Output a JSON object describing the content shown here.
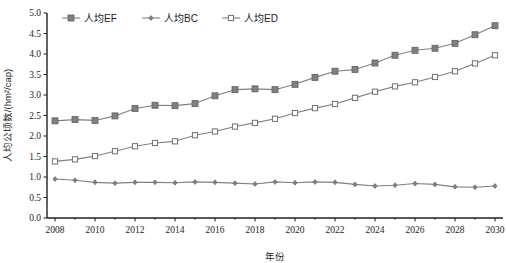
{
  "chart_data": {
    "type": "line",
    "title": "",
    "xlabel": "年份",
    "ylabel": "人均公顷数/(hm²/cap)",
    "xlim": [
      2007.6,
      2030.4
    ],
    "ylim": [
      0.0,
      5.0
    ],
    "ytick_step": 0.5,
    "xtick_step": 2,
    "grid": false,
    "legend_position": "top-left",
    "x": [
      2008,
      2009,
      2010,
      2011,
      2012,
      2013,
      2014,
      2015,
      2016,
      2017,
      2018,
      2019,
      2020,
      2021,
      2022,
      2023,
      2024,
      2025,
      2026,
      2027,
      2028,
      2029,
      2030
    ],
    "xticks": [
      "2008",
      "2010",
      "2012",
      "2014",
      "2016",
      "2018",
      "2020",
      "2022",
      "2024",
      "2026",
      "2028",
      "2030"
    ],
    "xtick_values": [
      2008,
      2010,
      2012,
      2014,
      2016,
      2018,
      2020,
      2022,
      2024,
      2026,
      2028,
      2030
    ],
    "yticks": [
      "0.0",
      "0.5",
      "1.0",
      "1.5",
      "2.0",
      "2.5",
      "3.0",
      "3.5",
      "4.0",
      "4.5",
      "5.0"
    ],
    "ytick_values": [
      0.0,
      0.5,
      1.0,
      1.5,
      2.0,
      2.5,
      3.0,
      3.5,
      4.0,
      4.5,
      5.0
    ],
    "series": [
      {
        "name": "人均EF",
        "marker": "filled-square",
        "color": "#808080",
        "values": [
          2.37,
          2.4,
          2.38,
          2.49,
          2.67,
          2.75,
          2.74,
          2.79,
          2.98,
          3.13,
          3.15,
          3.13,
          3.26,
          3.43,
          3.58,
          3.62,
          3.78,
          3.97,
          4.09,
          4.14,
          4.26,
          4.47,
          4.69
        ]
      },
      {
        "name": "人均BC",
        "marker": "filled-diamond",
        "color": "#808080",
        "values": [
          0.95,
          0.92,
          0.87,
          0.85,
          0.87,
          0.87,
          0.86,
          0.88,
          0.87,
          0.85,
          0.83,
          0.88,
          0.86,
          0.88,
          0.87,
          0.82,
          0.78,
          0.8,
          0.84,
          0.82,
          0.76,
          0.75,
          0.78
        ]
      },
      {
        "name": "人均ED",
        "marker": "open-square",
        "color": "#808080",
        "values": [
          1.38,
          1.43,
          1.51,
          1.63,
          1.75,
          1.83,
          1.87,
          2.02,
          2.11,
          2.23,
          2.32,
          2.42,
          2.56,
          2.68,
          2.78,
          2.93,
          3.08,
          3.21,
          3.31,
          3.44,
          3.58,
          3.77,
          3.97
        ]
      }
    ]
  },
  "legend": {
    "items": [
      {
        "label": "人均EF"
      },
      {
        "label": "人均BC"
      },
      {
        "label": "人均ED"
      }
    ]
  }
}
